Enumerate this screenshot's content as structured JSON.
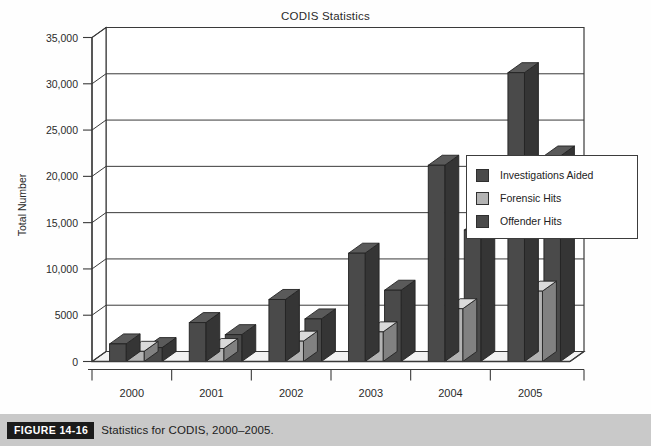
{
  "chart_data": {
    "type": "bar",
    "title": "CODIS Statistics",
    "xlabel": "",
    "ylabel": "Total Number",
    "categories": [
      "2000",
      "2001",
      "2002",
      "2003",
      "2004",
      "2005"
    ],
    "series": [
      {
        "name": "Investigations Aided",
        "color": "#4a4a4a",
        "values": [
          1900,
          4200,
          6700,
          11700,
          21200,
          31200
        ]
      },
      {
        "name": "Forensic Hits",
        "color": "#b3b3b3",
        "values": [
          1100,
          1400,
          2200,
          3200,
          5700,
          7600
        ]
      },
      {
        "name": "Offender Hits",
        "color": "#4a4a4a",
        "values": [
          1500,
          2900,
          4600,
          7700,
          14200,
          22200
        ]
      }
    ],
    "ylim": [
      0,
      35000
    ],
    "yticks": [
      0,
      5000,
      10000,
      15000,
      20000,
      25000,
      30000,
      35000
    ],
    "ytick_labels": [
      "0",
      "5000",
      "10,000",
      "15,000",
      "20,000",
      "25,000",
      "30,000",
      "35,000"
    ],
    "grid": true,
    "legend_position": "right",
    "style": "3d-perspective"
  },
  "legend": {
    "entries": [
      {
        "label": "Investigations Aided",
        "color": "#4a4a4a"
      },
      {
        "label": "Forensic Hits",
        "color": "#b3b3b3"
      },
      {
        "label": "Offender Hits",
        "color": "#4a4a4a"
      }
    ]
  },
  "caption": {
    "figure_number": "FIGURE 14-16",
    "text": "Statistics for CODIS, 2000–2005."
  }
}
